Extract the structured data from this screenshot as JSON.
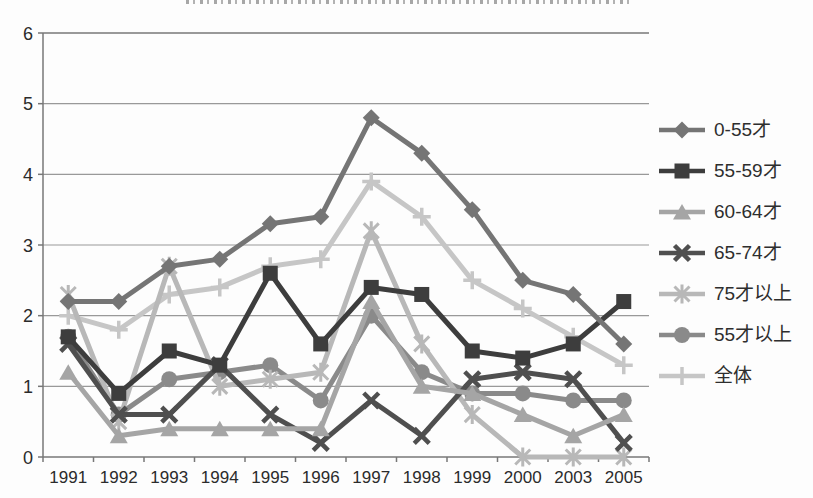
{
  "chart_data": {
    "type": "line",
    "title": "",
    "categories": [
      "1991",
      "1992",
      "1993",
      "1994",
      "1995",
      "1996",
      "1997",
      "1998",
      "1999",
      "2000",
      "2003",
      "2005"
    ],
    "series": [
      {
        "name": "0-55才",
        "marker": "diamond",
        "color": "#757575",
        "values": [
          2.2,
          2.2,
          2.7,
          2.8,
          3.3,
          3.4,
          4.8,
          4.3,
          3.5,
          2.5,
          2.3,
          1.6
        ]
      },
      {
        "name": "55-59才",
        "marker": "square",
        "color": "#3d3d3d",
        "values": [
          1.7,
          0.9,
          1.5,
          1.3,
          2.6,
          1.6,
          2.4,
          2.3,
          1.5,
          1.4,
          1.6,
          2.2
        ]
      },
      {
        "name": "60-64才",
        "marker": "triangle",
        "color": "#a5a5a5",
        "values": [
          1.2,
          0.3,
          0.4,
          0.4,
          0.4,
          0.4,
          2.2,
          1.0,
          0.9,
          0.6,
          0.3,
          0.6
        ]
      },
      {
        "name": "65-74才",
        "marker": "x",
        "color": "#4f4f4f",
        "values": [
          1.6,
          0.6,
          0.6,
          1.3,
          0.6,
          0.2,
          0.8,
          0.3,
          1.1,
          1.2,
          1.1,
          0.2
        ]
      },
      {
        "name": "75才以上",
        "marker": "asterisk",
        "color": "#b8b8b8",
        "values": [
          2.3,
          0.5,
          2.7,
          1.0,
          1.1,
          1.2,
          3.2,
          1.6,
          0.6,
          0.0,
          0.0,
          0.0
        ]
      },
      {
        "name": "55才以上",
        "marker": "circle",
        "color": "#8a8a8a",
        "values": [
          1.7,
          0.6,
          1.1,
          1.2,
          1.3,
          0.8,
          2.0,
          1.2,
          0.9,
          0.9,
          0.8,
          0.8
        ]
      },
      {
        "name": "全体",
        "marker": "plus",
        "color": "#c6c6c6",
        "values": [
          2.0,
          1.8,
          2.3,
          2.4,
          2.7,
          2.8,
          3.9,
          3.4,
          2.5,
          2.1,
          1.7,
          1.3
        ]
      }
    ],
    "ylim": [
      0,
      6
    ],
    "yticks": [
      0,
      1,
      2,
      3,
      4,
      5,
      6
    ],
    "grid": "horizontal",
    "legend_position": "right",
    "grid_color": "#999999",
    "axis_color": "#777777",
    "text_color": "#2b2b2b"
  }
}
